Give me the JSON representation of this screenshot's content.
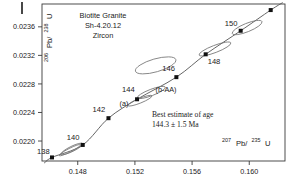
{
  "figure": {
    "title_lines": [
      "Biotite Granite",
      "Sh-4.20.12",
      "Zircon"
    ],
    "age_estimate_lines": [
      "Best estimate of age",
      "144.3 ± 1.5 Ma"
    ],
    "annotations": [
      {
        "name": "ellipse-a-label",
        "text": "(a)",
        "x": 124,
        "y": 106
      },
      {
        "name": "ellipse-b-aa-label",
        "text": "(b-AA)",
        "x": 166,
        "y": 92
      }
    ],
    "colors": {
      "axis": "#3a3a3a",
      "curve": "#555555",
      "marker": "#111111",
      "ellipse": "#777777",
      "text": "#1a1a1a",
      "background": "#ffffff"
    }
  },
  "axes": {
    "x": {
      "label_base": "Pb/",
      "label_sup1": "207",
      "label_sup2": "235",
      "label_tail": "U",
      "ticks": [
        "0.148",
        "0.152",
        "0.156",
        "0.160"
      ],
      "tick_values": [
        0.148,
        0.152,
        0.156,
        0.16
      ],
      "range": [
        0.1455,
        0.1625
      ]
    },
    "y": {
      "label_base": "Pb/",
      "label_sup1": "206",
      "label_sup2": "238",
      "label_tail": "U",
      "ticks": [
        "0.0236",
        "0.0232",
        "0.0228",
        "0.0224",
        "0.0220"
      ],
      "tick_values": [
        0.0236,
        0.0232,
        0.0228,
        0.0224,
        0.022
      ],
      "range": [
        0.02172,
        0.02392
      ]
    }
  },
  "chart_data": {
    "type": "scatter",
    "xlabel": "207Pb/235U",
    "ylabel": "206Pb/238U",
    "xlim": [
      0.1455,
      0.1625
    ],
    "ylim": [
      0.02172,
      0.02392
    ],
    "grid": false,
    "legend": "none",
    "concordia_curve": {
      "name": "concordia",
      "age_ticks_ma": [
        138,
        140,
        142,
        144,
        146,
        148,
        150
      ],
      "points": [
        {
          "age_ma": 138,
          "x": 0.1462,
          "y": 0.02177,
          "label": "138",
          "label_dx": -15,
          "label_dy": -3
        },
        {
          "age_ma": 140,
          "x": 0.14835,
          "y": 0.021945,
          "label": "140",
          "label_dx": -16,
          "label_dy": -5
        },
        {
          "age_ma": 142,
          "x": 0.15015,
          "y": 0.02232,
          "label": "142",
          "label_dx": -16,
          "label_dy": -6
        },
        {
          "age_ma": 144,
          "x": 0.15215,
          "y": 0.022585,
          "label": "144",
          "label_dx": -15,
          "label_dy": -7
        },
        {
          "age_ma": 146,
          "x": 0.1549,
          "y": 0.022895,
          "label": "146",
          "label_dx": -14,
          "label_dy": -6
        },
        {
          "age_ma": 148,
          "x": 0.15695,
          "y": 0.023215,
          "label": "148",
          "label_dx": 2,
          "label_dy": 10
        },
        {
          "age_ma": 150,
          "x": 0.1594,
          "y": 0.023545,
          "label": "150",
          "label_dx": -16,
          "label_dy": -5
        }
      ]
    },
    "extra_markers": [
      {
        "name": "upper-right-analysis",
        "x": 0.1615,
        "y": 0.023835
      }
    ],
    "error_ellipses": [
      {
        "name": "ellipse-upper-right-150",
        "cx": 0.15985,
        "cy": 0.02359,
        "rx": 16,
        "ry": 4.2,
        "angle": -22
      },
      {
        "name": "ellipse-upper-right-148",
        "cx": 0.1576,
        "cy": 0.02329,
        "rx": 17,
        "ry": 3.6,
        "angle": -21
      },
      {
        "name": "ellipse-mid-upper",
        "cx": 0.15345,
        "cy": 0.02306,
        "rx": 21,
        "ry": 6.5,
        "angle": -16
      },
      {
        "name": "ellipse-b-aa",
        "cx": 0.15315,
        "cy": 0.02268,
        "rx": 15,
        "ry": 3.2,
        "angle": -21
      },
      {
        "name": "ellipse-a",
        "cx": 0.15235,
        "cy": 0.022565,
        "rx": 13,
        "ry": 2.4,
        "angle": -22
      },
      {
        "name": "ellipse-140-low",
        "cx": 0.1476,
        "cy": 0.02189,
        "rx": 12,
        "ry": 2.6,
        "angle": -26
      },
      {
        "name": "ellipse-140-low-2",
        "cx": 0.14745,
        "cy": 0.021872,
        "rx": 12,
        "ry": 1.8,
        "angle": -27
      }
    ]
  }
}
